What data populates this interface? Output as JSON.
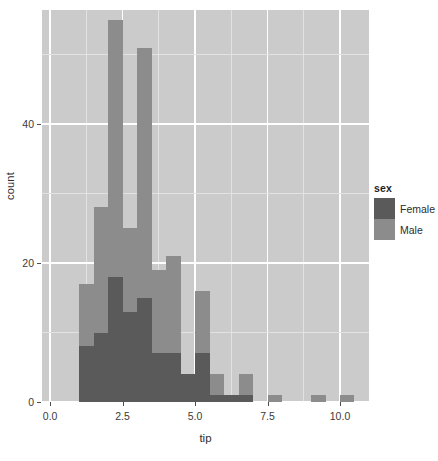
{
  "chart_data": {
    "type": "bar",
    "subtype": "histogram-overlay",
    "title": "",
    "xlabel": "tip",
    "ylabel": "count",
    "xlim": [
      -0.28,
      11.0
    ],
    "ylim": [
      0,
      56.4
    ],
    "grid": true,
    "binwidth": 0.5,
    "x_ticks": [
      "0.0",
      "2.5",
      "5.0",
      "7.5",
      "10.0"
    ],
    "x_tick_values": [
      0.0,
      2.5,
      5.0,
      7.5,
      10.0
    ],
    "y_ticks": [
      "0",
      "20",
      "40"
    ],
    "y_tick_values": [
      0,
      20,
      40
    ],
    "legend": {
      "title": "sex",
      "position": "right",
      "entries": [
        {
          "label": "Female",
          "color": "#5a5a5a"
        },
        {
          "label": "Male",
          "color": "#8c8c8c"
        }
      ]
    },
    "bins": [
      1.0,
      1.5,
      2.0,
      2.5,
      3.0,
      3.5,
      4.0,
      4.5,
      5.0,
      5.5,
      6.0,
      6.5,
      7.5,
      9.0,
      10.0
    ],
    "series": [
      {
        "name": "Male",
        "color": "#8c8c8c",
        "bars": [
          {
            "x0": 1.0,
            "x1": 1.5,
            "value": 17
          },
          {
            "x0": 1.5,
            "x1": 2.0,
            "value": 28
          },
          {
            "x0": 2.0,
            "x1": 2.5,
            "value": 55
          },
          {
            "x0": 2.5,
            "x1": 3.0,
            "value": 25
          },
          {
            "x0": 3.0,
            "x1": 3.5,
            "value": 51
          },
          {
            "x0": 3.5,
            "x1": 4.0,
            "value": 19
          },
          {
            "x0": 4.0,
            "x1": 4.5,
            "value": 21
          },
          {
            "x0": 4.5,
            "x1": 5.0,
            "value": 4
          },
          {
            "x0": 5.0,
            "x1": 5.5,
            "value": 16
          },
          {
            "x0": 5.5,
            "x1": 6.0,
            "value": 4
          },
          {
            "x0": 6.0,
            "x1": 6.5,
            "value": 1
          },
          {
            "x0": 6.5,
            "x1": 7.0,
            "value": 4
          },
          {
            "x0": 7.5,
            "x1": 8.0,
            "value": 1
          },
          {
            "x0": 9.0,
            "x1": 9.5,
            "value": 1
          },
          {
            "x0": 10.0,
            "x1": 10.5,
            "value": 1
          }
        ]
      },
      {
        "name": "Female",
        "color": "#5a5a5a",
        "bars": [
          {
            "x0": 1.0,
            "x1": 1.5,
            "value": 8
          },
          {
            "x0": 1.5,
            "x1": 2.0,
            "value": 10
          },
          {
            "x0": 2.0,
            "x1": 2.5,
            "value": 18
          },
          {
            "x0": 2.5,
            "x1": 3.0,
            "value": 13
          },
          {
            "x0": 3.0,
            "x1": 3.5,
            "value": 15
          },
          {
            "x0": 3.5,
            "x1": 4.0,
            "value": 7
          },
          {
            "x0": 4.0,
            "x1": 4.5,
            "value": 7
          },
          {
            "x0": 4.5,
            "x1": 5.0,
            "value": 4
          },
          {
            "x0": 5.0,
            "x1": 5.5,
            "value": 7
          },
          {
            "x0": 5.5,
            "x1": 6.0,
            "value": 1
          },
          {
            "x0": 6.0,
            "x1": 6.5,
            "value": 1
          },
          {
            "x0": 6.5,
            "x1": 7.0,
            "value": 1
          }
        ]
      }
    ]
  }
}
